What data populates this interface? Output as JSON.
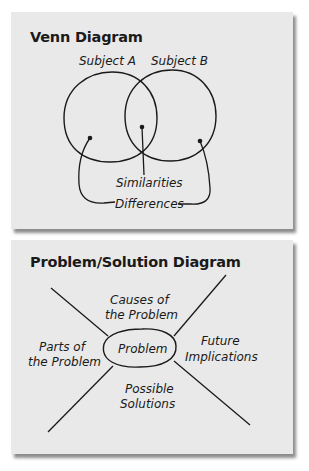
{
  "venn": {
    "title": "Venn Diagram",
    "labels": {
      "subject_a": "Subject A",
      "subject_b": "Subject B",
      "similarities": "Similarities",
      "differences": "Differences"
    }
  },
  "problem_solution": {
    "title": "Problem/Solution Diagram",
    "labels": {
      "center": "Problem",
      "causes_line1": "Causes of",
      "causes_line2": "the Problem",
      "parts_line1": "Parts of",
      "parts_line2": "the Problem",
      "future_line1": "Future",
      "future_line2": "Implications",
      "solutions_line1": "Possible",
      "solutions_line2": "Solutions"
    }
  },
  "colors": {
    "panel_bg": "#e9e9e9",
    "ink": "#1a1a1a"
  }
}
